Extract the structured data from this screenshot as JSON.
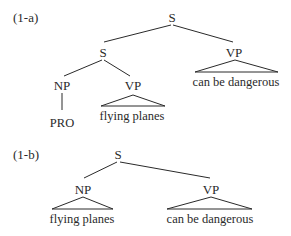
{
  "trees": [
    {
      "label": "(1-a)",
      "nodes": {
        "root": "S",
        "inner_s": "S",
        "np": "NP",
        "inner_vp": "VP",
        "outer_vp": "VP"
      },
      "leaves": {
        "pro": "PRO",
        "inner_vp_text": "flying planes",
        "outer_vp_text": "can be dangerous"
      }
    },
    {
      "label": "(1-b)",
      "nodes": {
        "root": "S",
        "np": "NP",
        "vp": "VP"
      },
      "leaves": {
        "np_text": "flying planes",
        "vp_text": "can be dangerous"
      }
    }
  ],
  "colors": {
    "ink": "#2a2a2a",
    "background": "#ffffff"
  }
}
